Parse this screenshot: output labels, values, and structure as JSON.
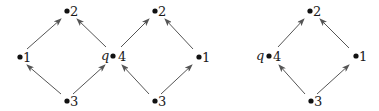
{
  "diagrams": [
    {
      "nodes": [
        {
          "id": "a2",
          "label": "2",
          "x": 67,
          "y": 11
        },
        {
          "id": "a1",
          "label": "1",
          "x": 20,
          "y": 57
        },
        {
          "id": "a4",
          "label": "4",
          "x": 113,
          "y": 56,
          "annotation": "q"
        },
        {
          "id": "a3",
          "label": "3",
          "x": 67,
          "y": 101
        }
      ],
      "edges": [
        [
          "a3",
          "a1"
        ],
        [
          "a3",
          "a4"
        ],
        [
          "a1",
          "a2"
        ],
        [
          "a4",
          "a2"
        ]
      ]
    },
    {
      "nodes": [
        {
          "id": "b2",
          "label": "2",
          "x": 155,
          "y": 11
        },
        {
          "id": "b4",
          "label": "4",
          "x": 113,
          "y": 56
        },
        {
          "id": "b1",
          "label": "1",
          "x": 199,
          "y": 57
        },
        {
          "id": "b3",
          "label": "3",
          "x": 155,
          "y": 101
        }
      ],
      "edges": [
        [
          "b3",
          "b4"
        ],
        [
          "b3",
          "b1"
        ],
        [
          "b4",
          "b2"
        ],
        [
          "b1",
          "b2"
        ]
      ]
    },
    {
      "nodes": [
        {
          "id": "c2",
          "label": "2",
          "x": 310,
          "y": 11
        },
        {
          "id": "c4",
          "label": "4",
          "x": 269,
          "y": 56,
          "annotation": "q"
        },
        {
          "id": "c1",
          "label": "1",
          "x": 356,
          "y": 56
        },
        {
          "id": "c3",
          "label": "3",
          "x": 311,
          "y": 101
        }
      ],
      "edges": [
        [
          "c3",
          "c4"
        ],
        [
          "c3",
          "c1"
        ],
        [
          "c4",
          "c2"
        ],
        [
          "c1",
          "c2"
        ]
      ]
    }
  ],
  "labels": {
    "a2": "2",
    "a1": "1",
    "a4": "4",
    "a3": "3",
    "aq": "q",
    "b2": "2",
    "b1": "1",
    "b3": "3",
    "c2": "2",
    "c4": "4",
    "c1": "1",
    "c3": "3",
    "cq": "q"
  }
}
